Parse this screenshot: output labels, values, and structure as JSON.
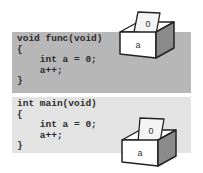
{
  "panels": [
    {
      "name": "func",
      "code_lines": [
        "void func(void)",
        "{",
        "    int a = 0;",
        "    a++;",
        "}"
      ],
      "box": {
        "card_value": "0",
        "label": "a"
      },
      "background": "#b7b7b7"
    },
    {
      "name": "main",
      "code_lines": [
        "int main(void)",
        "{",
        "    int a = 0;",
        "    a++;",
        "}"
      ],
      "box": {
        "card_value": "0",
        "label": "a"
      },
      "background": "#e3e3e3"
    }
  ]
}
